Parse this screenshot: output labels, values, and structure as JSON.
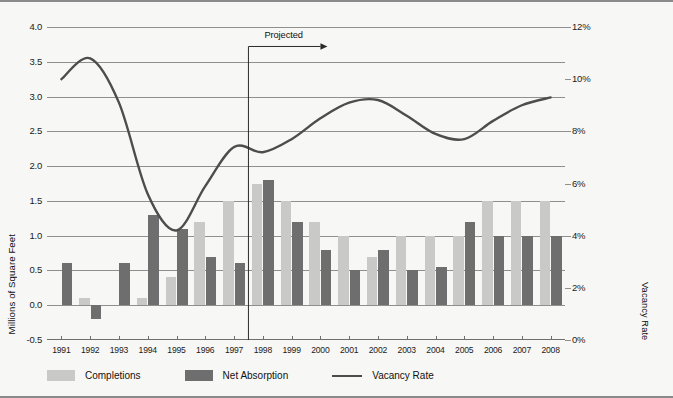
{
  "annotation": {
    "projected_label": "Projected"
  },
  "axes": {
    "left_title": "Millions of Square Feet",
    "right_title": "Vacancy Rate",
    "left_ticks": [
      "4.0",
      "3.5",
      "3.0",
      "2.5",
      "2.0",
      "1.5",
      "1.0",
      "0.5",
      "0.0",
      "-0.5"
    ],
    "right_ticks": [
      "12%",
      "10%",
      "8%",
      "6%",
      "4%",
      "2%",
      "0%"
    ]
  },
  "legend": {
    "items": [
      {
        "label": "Completions",
        "type": "swatch",
        "color": "#c9c9c7"
      },
      {
        "label": "Net Absorption",
        "type": "swatch",
        "color": "#6e6e6e"
      },
      {
        "label": "Vacancy Rate",
        "type": "line",
        "color": "#4d4d4d"
      }
    ]
  },
  "chart_data": {
    "type": "bar",
    "title": "",
    "xlabel": "",
    "ylabel": "Millions of Square Feet",
    "y2label": "Vacancy Rate",
    "ylim": [
      -0.5,
      4.0
    ],
    "y2lim": [
      0,
      12
    ],
    "grid": true,
    "legend_position": "bottom-left",
    "categories": [
      "1991",
      "1992",
      "1993",
      "1994",
      "1995",
      "1996",
      "1997",
      "1998",
      "1999",
      "2000",
      "2001",
      "2002",
      "2003",
      "2004",
      "2005",
      "2006",
      "2007",
      "2008"
    ],
    "series": [
      {
        "name": "Completions",
        "type": "bar",
        "axis": "left",
        "color": "#c9c9c7",
        "values": [
          0,
          0.1,
          0,
          0.1,
          0.4,
          1.2,
          1.5,
          1.75,
          1.5,
          1.2,
          1.0,
          0.7,
          1.0,
          1.0,
          1.0,
          1.5,
          1.5,
          1.5
        ]
      },
      {
        "name": "Net Absorption",
        "type": "bar",
        "axis": "left",
        "color": "#6e6e6e",
        "values": [
          0.6,
          -0.2,
          0.6,
          1.3,
          1.1,
          0.7,
          0.6,
          1.8,
          1.2,
          0.8,
          0.5,
          0.8,
          0.5,
          0.55,
          1.2,
          1.0,
          1.0,
          1.0
        ]
      },
      {
        "name": "Vacancy Rate",
        "type": "line",
        "axis": "right",
        "color": "#4d4d4d",
        "unit": "%",
        "values": [
          10.0,
          10.8,
          9.1,
          5.6,
          4.2,
          5.9,
          7.4,
          7.2,
          7.7,
          8.5,
          9.1,
          9.2,
          8.6,
          7.9,
          7.7,
          8.4,
          9.0,
          9.3
        ]
      }
    ],
    "annotations": [
      {
        "text": "Projected",
        "x_start": "1998",
        "direction": "right"
      }
    ]
  }
}
